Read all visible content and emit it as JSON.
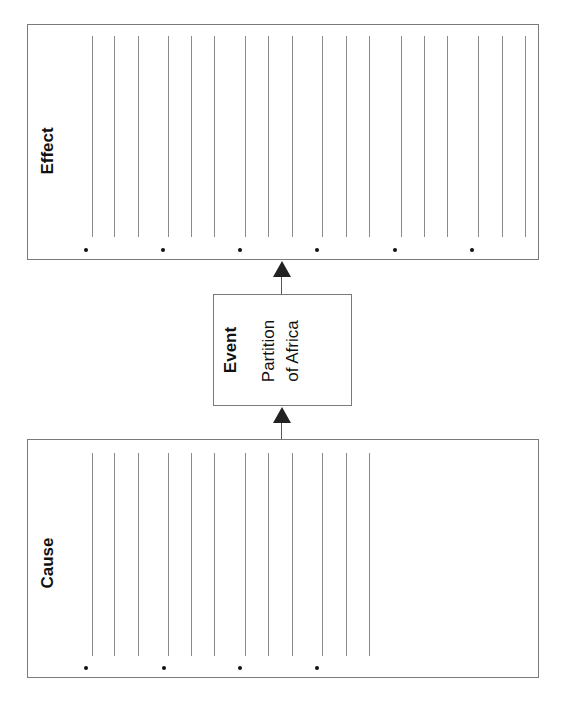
{
  "effect": {
    "title": "Effect",
    "line_x": [
      92,
      114,
      138,
      168,
      191,
      214,
      245,
      268,
      292,
      322,
      346,
      369,
      401,
      424,
      447,
      478,
      502,
      525
    ],
    "bullet_x": [
      86,
      163,
      240,
      317,
      395,
      472
    ]
  },
  "event": {
    "title": "Event",
    "text_line1": "Partition",
    "text_line2": "of Africa"
  },
  "cause": {
    "title": "Cause",
    "line_x": [
      92,
      114,
      138,
      168,
      191,
      214,
      245,
      268,
      292,
      322,
      346,
      369
    ],
    "bullet_x": [
      86,
      164,
      240,
      317
    ]
  },
  "colors": {
    "border": "#7a7a7a",
    "line": "#8a8a8a",
    "arrow": "#222222"
  }
}
